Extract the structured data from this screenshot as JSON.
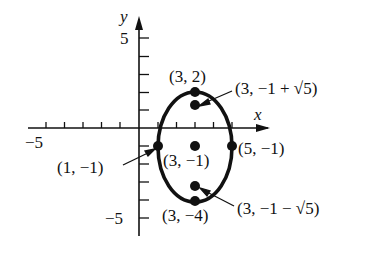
{
  "figure": {
    "type": "ellipse-graph",
    "axes": {
      "x_label": "x",
      "y_label": "y",
      "x_tick_label_neg": "−5",
      "y_tick_label_pos": "5",
      "y_tick_label_neg": "−5",
      "x_range": [
        -5,
        5
      ],
      "y_range": [
        -5,
        5
      ]
    },
    "ellipse": {
      "center": [
        3,
        -1
      ],
      "semi_major_vertical": 3,
      "semi_minor_horizontal": 2,
      "equation": "(x−3)²/4 + (y+1)²/9 = 1"
    },
    "points": [
      {
        "id": "top-vertex",
        "label": "(3, 2)",
        "x": 3,
        "y": 2
      },
      {
        "id": "bottom-vertex",
        "label": "(3, −4)",
        "x": 3,
        "y": -4
      },
      {
        "id": "left-vertex",
        "label": "(1, −1)",
        "x": 1,
        "y": -1
      },
      {
        "id": "right-vertex",
        "label": "(5, −1)",
        "x": 5,
        "y": -1
      },
      {
        "id": "center",
        "label": "(3, −1)",
        "x": 3,
        "y": -1
      },
      {
        "id": "focus-upper",
        "label": "(3, −1 + √5)",
        "x": 3,
        "y": 1.236
      },
      {
        "id": "focus-lower",
        "label": "(3, −1 − √5)",
        "x": 3,
        "y": -3.236
      }
    ],
    "colors": {
      "ink": "#111111",
      "background": "#ffffff"
    }
  }
}
